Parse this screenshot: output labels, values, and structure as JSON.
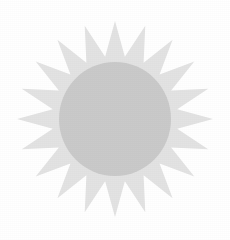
{
  "canvas": {
    "width": 230,
    "height": 240,
    "background_color": "#ffffff"
  },
  "graphic": {
    "name": "sunburst-star",
    "description": "Pale grey sunburst: spiked star ring surrounding a solid circular disc",
    "center_x": 115,
    "center_y": 119
  },
  "sunburst": {
    "label": "sunburst-rays",
    "fill_color": "#e3e3e3",
    "spike_count": 20,
    "outer_radius": 98,
    "inner_radius": 63,
    "rotation_deg": -90
  },
  "disc": {
    "label": "inner-disc",
    "fill_color": "#cacaca",
    "radius_x": 56,
    "radius_y": 57,
    "center_x": 115,
    "center_y": 119
  },
  "palette": {
    "background": "#ffffff",
    "rays": "#e3e3e3",
    "disc": "#cacaca"
  }
}
